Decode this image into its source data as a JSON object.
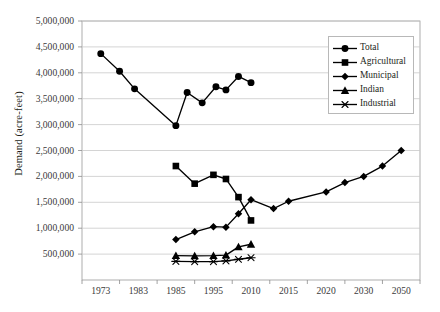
{
  "chart_data": {
    "type": "line",
    "title": "",
    "xlabel": "",
    "ylabel": "Demand (acre-feet)",
    "grid": true,
    "legend_position": "top-right",
    "ylim": [
      0,
      5000000
    ],
    "yticks": [
      500000,
      1000000,
      1500000,
      2000000,
      2500000,
      3000000,
      3500000,
      4000000,
      4500000,
      5000000
    ],
    "ytick_labels": [
      "500,000",
      "1,000,000",
      "1,500,000",
      "2,000,000",
      "2,500,000",
      "3,000,000",
      "3,500,000",
      "4,000,000",
      "4,500,000",
      "5,000,000"
    ],
    "categories": [
      "1973",
      "1983",
      "1985",
      "1995",
      "2010",
      "2015",
      "2020",
      "2030",
      "2050"
    ],
    "x": [
      1973,
      1983,
      1985,
      1995,
      2010,
      2015,
      2020,
      2030,
      2050
    ],
    "series": [
      {
        "name": "Total",
        "marker": "circle",
        "color": "#000000",
        "points": [
          {
            "x": 1973,
            "y": 4370000
          },
          {
            "x": 1978,
            "y": 4030000
          },
          {
            "x": 1982,
            "y": 3690000
          },
          {
            "x": 1985,
            "y": 2980000
          },
          {
            "x": 1988,
            "y": 3620000
          },
          {
            "x": 1992,
            "y": 3420000
          },
          {
            "x": 1996,
            "y": 3730000
          },
          {
            "x": 2000,
            "y": 3670000
          },
          {
            "x": 2005,
            "y": 3930000
          },
          {
            "x": 2010,
            "y": 3810000
          }
        ]
      },
      {
        "name": "Agricultural",
        "marker": "square",
        "color": "#000000",
        "points": [
          {
            "x": 1985,
            "y": 2200000
          },
          {
            "x": 1990,
            "y": 1860000
          },
          {
            "x": 1995,
            "y": 2030000
          },
          {
            "x": 2000,
            "y": 1950000
          },
          {
            "x": 2005,
            "y": 1600000
          },
          {
            "x": 2010,
            "y": 1150000
          }
        ]
      },
      {
        "name": "Municipal",
        "marker": "diamond",
        "color": "#000000",
        "points": [
          {
            "x": 1985,
            "y": 780000
          },
          {
            "x": 1990,
            "y": 930000
          },
          {
            "x": 1995,
            "y": 1030000
          },
          {
            "x": 2000,
            "y": 1020000
          },
          {
            "x": 2005,
            "y": 1280000
          },
          {
            "x": 2010,
            "y": 1550000
          },
          {
            "x": 2013,
            "y": 1380000
          },
          {
            "x": 2015,
            "y": 1520000
          },
          {
            "x": 2020,
            "y": 1700000
          },
          {
            "x": 2025,
            "y": 1880000
          },
          {
            "x": 2030,
            "y": 2000000
          },
          {
            "x": 2040,
            "y": 2200000
          },
          {
            "x": 2050,
            "y": 2500000
          }
        ]
      },
      {
        "name": "Indian",
        "marker": "triangle",
        "color": "#000000",
        "points": [
          {
            "x": 1985,
            "y": 470000
          },
          {
            "x": 1990,
            "y": 465000
          },
          {
            "x": 1995,
            "y": 470000
          },
          {
            "x": 2000,
            "y": 480000
          },
          {
            "x": 2005,
            "y": 640000
          },
          {
            "x": 2010,
            "y": 690000
          }
        ]
      },
      {
        "name": "Industrial",
        "marker": "asterisk",
        "color": "#000000",
        "points": [
          {
            "x": 1985,
            "y": 360000
          },
          {
            "x": 1990,
            "y": 355000
          },
          {
            "x": 1995,
            "y": 355000
          },
          {
            "x": 2000,
            "y": 370000
          },
          {
            "x": 2005,
            "y": 400000
          },
          {
            "x": 2010,
            "y": 430000
          }
        ]
      }
    ]
  },
  "legend": {
    "items": [
      {
        "label": "Total",
        "marker": "circle"
      },
      {
        "label": "Agricultural",
        "marker": "square"
      },
      {
        "label": "Municipal",
        "marker": "diamond"
      },
      {
        "label": "Indian",
        "marker": "triangle"
      },
      {
        "label": "Industrial",
        "marker": "asterisk"
      }
    ]
  }
}
